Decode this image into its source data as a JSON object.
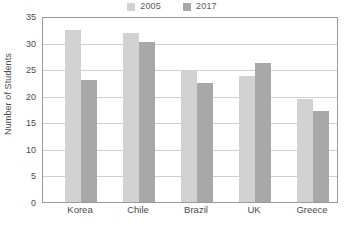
{
  "chart_data": {
    "type": "bar",
    "title": "",
    "xlabel": "",
    "ylabel": "Number of Students",
    "categories": [
      "Korea",
      "Chile",
      "Brazil",
      "UK",
      "Greece"
    ],
    "series": [
      {
        "name": "2005",
        "color": "#d2d2d2",
        "values": [
          32.4,
          31.8,
          24.7,
          23.8,
          19.4
        ]
      },
      {
        "name": "2017",
        "color": "#a8a8a8",
        "values": [
          23.0,
          30.2,
          22.4,
          26.1,
          17.1
        ]
      }
    ],
    "ylim": [
      0,
      35
    ],
    "ytick_step": 5,
    "yticks": [
      0,
      5,
      10,
      15,
      20,
      25,
      30,
      35
    ],
    "ytick_labels": [
      "0",
      "5",
      "10",
      "15",
      "20",
      "25",
      "30",
      "35"
    ],
    "grid": true,
    "grid_axis": "y",
    "legend_position": "top-center",
    "frame": true,
    "frame_color": "#9a9a9a",
    "grid_color": "#cfcfcf",
    "background": "#ffffff"
  }
}
